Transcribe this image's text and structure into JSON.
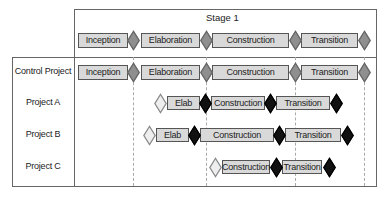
{
  "header": {
    "stage_label": "Stage 1",
    "phases": [
      {
        "label": "Inception",
        "x": 78,
        "w": 50
      },
      {
        "label": "Elaboration",
        "x": 141,
        "w": 59
      },
      {
        "label": "Construction",
        "x": 212,
        "w": 77
      },
      {
        "label": "Transition",
        "x": 301,
        "w": 57
      }
    ],
    "milestones": [
      {
        "type": "grey",
        "x": 133
      },
      {
        "type": "grey",
        "x": 206
      },
      {
        "type": "grey",
        "x": 295
      },
      {
        "type": "grey",
        "x": 364
      }
    ]
  },
  "rows": [
    {
      "label": "Control Project",
      "phases": [
        {
          "label": "Inception",
          "x": 78,
          "w": 50
        },
        {
          "label": "Elaboration",
          "x": 141,
          "w": 59
        },
        {
          "label": "Construction",
          "x": 212,
          "w": 77
        },
        {
          "label": "Transition",
          "x": 301,
          "w": 57
        }
      ],
      "milestones": [
        {
          "type": "grey",
          "x": 133
        },
        {
          "type": "grey",
          "x": 206
        },
        {
          "type": "grey",
          "x": 295
        },
        {
          "type": "grey",
          "x": 364
        }
      ]
    },
    {
      "label": "Project A",
      "phases": [
        {
          "label": "Elab",
          "x": 167,
          "w": 33
        },
        {
          "label": "Construction",
          "x": 211,
          "w": 54
        },
        {
          "label": "Transition",
          "x": 276,
          "w": 54
        }
      ],
      "milestones": [
        {
          "type": "hollow",
          "x": 160
        },
        {
          "type": "black",
          "x": 205
        },
        {
          "type": "black",
          "x": 270
        },
        {
          "type": "black",
          "x": 336
        }
      ]
    },
    {
      "label": "Project B",
      "phases": [
        {
          "label": "Elab",
          "x": 156,
          "w": 33
        },
        {
          "label": "Construction",
          "x": 200,
          "w": 74
        },
        {
          "label": "Transition",
          "x": 285,
          "w": 56
        }
      ],
      "milestones": [
        {
          "type": "hollow",
          "x": 149
        },
        {
          "type": "black",
          "x": 194
        },
        {
          "type": "black",
          "x": 279
        },
        {
          "type": "black",
          "x": 347
        }
      ]
    },
    {
      "label": "Project C",
      "phases": [
        {
          "label": "Construction",
          "x": 222,
          "w": 48
        },
        {
          "label": "Transition",
          "x": 282,
          "w": 40
        }
      ],
      "milestones": [
        {
          "type": "hollow",
          "x": 215
        },
        {
          "type": "black",
          "x": 276
        },
        {
          "type": "black",
          "x": 329
        }
      ]
    }
  ],
  "colors": {
    "phase_fill": "#d9d9d9",
    "grey_milestone": "#8f8f8f",
    "black_milestone": "#111111",
    "hollow_milestone": "#eeeeee",
    "border": "#666666",
    "dashed_guides": "#aaaaaa"
  }
}
